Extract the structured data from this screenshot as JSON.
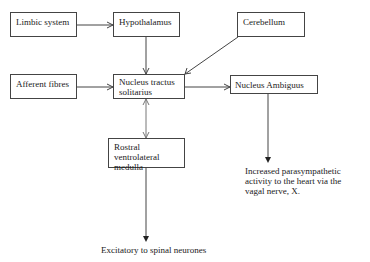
{
  "diagram": {
    "nodes": {
      "limbic": {
        "label": "Limbic system"
      },
      "hypothalamus": {
        "label": "Hypothalamus"
      },
      "cerebellum": {
        "label": "Cerebellum"
      },
      "afferent": {
        "label": "Afferent fibres"
      },
      "nts": {
        "label": "Nucleus tractus solitarius"
      },
      "ambiguus": {
        "label": "Nucleus Ambiguus"
      },
      "rvlm": {
        "label": "Rostral ventrolateral medulla"
      }
    },
    "outputs": {
      "parasympathetic": {
        "label": "Increased parasympathetic activity to the heart via the vagal nerve, X."
      },
      "spinal": {
        "label": "Excitatory to spinal neurones"
      }
    },
    "edges": [
      {
        "from": "limbic",
        "to": "hypothalamus",
        "type": "open-arrow"
      },
      {
        "from": "hypothalamus",
        "to": "nts",
        "type": "open-arrow"
      },
      {
        "from": "cerebellum",
        "to": "nts",
        "type": "open-arrow"
      },
      {
        "from": "afferent",
        "to": "nts",
        "type": "open-arrow"
      },
      {
        "from": "nts",
        "to": "ambiguus",
        "type": "open-arrow"
      },
      {
        "from": "nts",
        "to": "rvlm",
        "type": "bidirectional-open-arrow"
      },
      {
        "from": "ambiguus",
        "to": "parasympathetic",
        "type": "filled-arrow"
      },
      {
        "from": "rvlm",
        "to": "spinal",
        "type": "filled-arrow"
      }
    ]
  }
}
